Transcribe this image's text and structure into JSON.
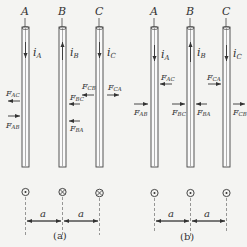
{
  "figure": {
    "panels": [
      {
        "id": "a",
        "caption": "(a)",
        "conductors": [
          {
            "name": "A",
            "current_label": "i",
            "current_sub": "A",
            "current_dir": "down",
            "end_symbol": "dot"
          },
          {
            "name": "B",
            "current_label": "i",
            "current_sub": "B",
            "current_dir": "up",
            "end_symbol": "cross"
          },
          {
            "name": "C",
            "current_label": "i",
            "current_sub": "C",
            "current_dir": "down",
            "end_symbol": "cross"
          }
        ],
        "forces": [
          {
            "label": "F",
            "sub": "AC",
            "conductor": "A",
            "side": "left",
            "dir": "left"
          },
          {
            "label": "F",
            "sub": "AB",
            "conductor": "A",
            "side": "left",
            "dir": "right"
          },
          {
            "label": "F",
            "sub": "BC",
            "conductor": "B",
            "side": "right",
            "dir": "left"
          },
          {
            "label": "F",
            "sub": "BA",
            "conductor": "B",
            "side": "right",
            "dir": "left"
          },
          {
            "label": "F",
            "sub": "CB",
            "conductor": "C",
            "side": "left",
            "dir": "left"
          },
          {
            "label": "F",
            "sub": "CA",
            "conductor": "C",
            "side": "right",
            "dir": "right"
          }
        ],
        "spacing_label": "a"
      },
      {
        "id": "b",
        "caption": "(b)",
        "conductors": [
          {
            "name": "A",
            "current_label": "i",
            "current_sub": "A",
            "current_dir": "down",
            "end_symbol": "dot"
          },
          {
            "name": "B",
            "current_label": "i",
            "current_sub": "B",
            "current_dir": "up",
            "end_symbol": "dot"
          },
          {
            "name": "C",
            "current_label": "i",
            "current_sub": "C",
            "current_dir": "down",
            "end_symbol": "dot"
          }
        ],
        "forces": [
          {
            "label": "F",
            "sub": "AC",
            "conductor": "A",
            "side": "right",
            "dir": "left"
          },
          {
            "label": "F",
            "sub": "AB",
            "conductor": "A",
            "side": "left",
            "dir": "right"
          },
          {
            "label": "F",
            "sub": "BC",
            "conductor": "B",
            "side": "left",
            "dir": "right"
          },
          {
            "label": "F",
            "sub": "BA",
            "conductor": "B",
            "side": "right",
            "dir": "left"
          },
          {
            "label": "F",
            "sub": "CA",
            "conductor": "C",
            "side": "left",
            "dir": "right"
          },
          {
            "label": "F",
            "sub": "CB",
            "conductor": "C",
            "side": "right",
            "dir": "right"
          }
        ],
        "spacing_label": "a"
      }
    ]
  }
}
